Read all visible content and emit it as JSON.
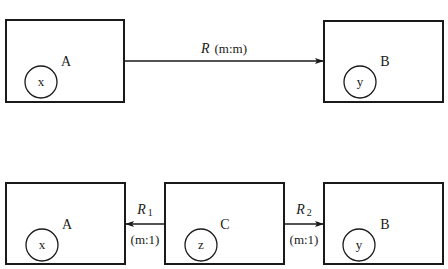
{
  "diagram": {
    "colors": {
      "stroke": "#1a1a1a",
      "background": "#ffffff"
    },
    "top_row": {
      "entity_left": {
        "label": "A",
        "attribute": "x"
      },
      "entity_right": {
        "label": "B",
        "attribute": "y"
      },
      "relationship": {
        "name": "R",
        "cardinality": "(m:m)",
        "direction": "A-to-B"
      }
    },
    "bottom_row": {
      "entity_left": {
        "label": "A",
        "attribute": "x"
      },
      "entity_middle": {
        "label": "C",
        "attribute": "z"
      },
      "entity_right": {
        "label": "B",
        "attribute": "y"
      },
      "relationship_left": {
        "name": "R",
        "subscript": "1",
        "cardinality": "(m:1)",
        "direction": "C-to-A"
      },
      "relationship_right": {
        "name": "R",
        "subscript": "2",
        "cardinality": "(m:1)",
        "direction": "C-to-B"
      }
    }
  }
}
